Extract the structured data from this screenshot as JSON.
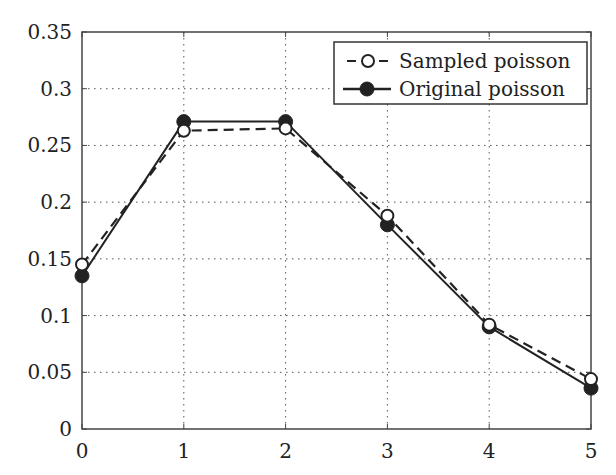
{
  "chart_data": {
    "type": "line",
    "title": "",
    "xlabel": "",
    "ylabel": "",
    "x": [
      0,
      1,
      2,
      3,
      4,
      5
    ],
    "xlim": [
      0,
      5
    ],
    "ylim": [
      0,
      0.35
    ],
    "x_ticks": [
      "0",
      "1",
      "2",
      "3",
      "4",
      "5"
    ],
    "y_ticks": [
      "0",
      "0.05",
      "0.1",
      "0.15",
      "0.2",
      "0.25",
      "0.3",
      "0.35"
    ],
    "grid": true,
    "legend_position": "upper right",
    "series": [
      {
        "name": "Sampled poisson",
        "line_style": "dashed",
        "marker": "open-circle",
        "values": [
          0.145,
          0.263,
          0.265,
          0.188,
          0.092,
          0.044
        ]
      },
      {
        "name": "Original poisson",
        "line_style": "solid",
        "marker": "filled-circle",
        "values": [
          0.135,
          0.271,
          0.271,
          0.18,
          0.09,
          0.036
        ]
      }
    ]
  },
  "colors": {
    "line": "#222222",
    "grid": "#555555",
    "axis": "#444444"
  }
}
